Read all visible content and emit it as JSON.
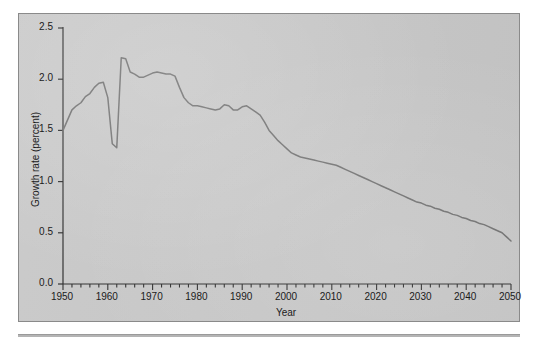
{
  "chart_data": {
    "type": "line",
    "title": "",
    "subtitle": "",
    "xlabel": "Year",
    "ylabel": "Growth rate (percent)",
    "xlim": [
      1950,
      2050
    ],
    "ylim": [
      0.0,
      2.5
    ],
    "grid": false,
    "legend": null,
    "legend_position": "none",
    "x_major_ticks": [
      1950,
      1960,
      1970,
      1980,
      1990,
      2000,
      2010,
      2020,
      2030,
      2040,
      2050
    ],
    "x_major_tick_labels": [
      "1950",
      "1960",
      "1970",
      "1980",
      "1990",
      "2000",
      "2010",
      "2020",
      "2030",
      "2040",
      "2050"
    ],
    "x_minor_tick_interval": 2,
    "y_ticks": [
      0.0,
      0.5,
      1.0,
      1.5,
      2.0,
      2.5
    ],
    "y_tick_labels": [
      "0.0",
      "0.5",
      "1.0",
      "1.5",
      "2.0",
      "2.5"
    ],
    "line_color": "#6e6e6e",
    "plot_background": "#c8c8c8",
    "series": [
      {
        "name": "World population growth rate",
        "x": [
          1950,
          1951,
          1952,
          1953,
          1954,
          1955,
          1956,
          1957,
          1958,
          1959,
          1960,
          1961,
          1962,
          1963,
          1964,
          1965,
          1966,
          1967,
          1968,
          1969,
          1970,
          1971,
          1972,
          1973,
          1974,
          1975,
          1976,
          1977,
          1978,
          1979,
          1980,
          1981,
          1982,
          1983,
          1984,
          1985,
          1986,
          1987,
          1988,
          1989,
          1990,
          1991,
          1992,
          1993,
          1994,
          1995,
          1996,
          1997,
          1998,
          1999,
          2000,
          2001,
          2002,
          2003,
          2004,
          2005,
          2006,
          2007,
          2008,
          2009,
          2010,
          2011,
          2012,
          2013,
          2014,
          2015,
          2016,
          2017,
          2018,
          2019,
          2020,
          2021,
          2022,
          2023,
          2024,
          2025,
          2026,
          2027,
          2028,
          2029,
          2030,
          2031,
          2032,
          2033,
          2034,
          2035,
          2036,
          2037,
          2038,
          2039,
          2040,
          2041,
          2042,
          2043,
          2044,
          2045,
          2046,
          2047,
          2048,
          2049,
          2050
        ],
        "y": [
          1.5,
          1.6,
          1.7,
          1.74,
          1.77,
          1.83,
          1.86,
          1.92,
          1.96,
          1.97,
          1.82,
          1.37,
          1.33,
          2.21,
          2.2,
          2.07,
          2.05,
          2.02,
          2.02,
          2.04,
          2.06,
          2.07,
          2.06,
          2.05,
          2.05,
          2.03,
          1.92,
          1.82,
          1.77,
          1.74,
          1.74,
          1.73,
          1.72,
          1.71,
          1.7,
          1.71,
          1.75,
          1.74,
          1.7,
          1.7,
          1.73,
          1.74,
          1.71,
          1.68,
          1.65,
          1.58,
          1.5,
          1.45,
          1.4,
          1.36,
          1.32,
          1.28,
          1.26,
          1.24,
          1.23,
          1.22,
          1.21,
          1.2,
          1.19,
          1.18,
          1.17,
          1.16,
          1.14,
          1.12,
          1.1,
          1.08,
          1.06,
          1.04,
          1.02,
          1.0,
          0.98,
          0.96,
          0.94,
          0.92,
          0.9,
          0.88,
          0.86,
          0.84,
          0.82,
          0.8,
          0.79,
          0.77,
          0.76,
          0.74,
          0.73,
          0.71,
          0.7,
          0.68,
          0.67,
          0.65,
          0.64,
          0.62,
          0.61,
          0.59,
          0.58,
          0.56,
          0.54,
          0.52,
          0.5,
          0.46,
          0.42
        ]
      }
    ],
    "annotations": [
      {
        "label": "peak",
        "year": 1963,
        "value": 2.21
      },
      {
        "label": "trough",
        "year": 1962,
        "value": 1.33
      },
      {
        "label": "start",
        "year": 1950,
        "value": 1.5
      },
      {
        "label": "end",
        "year": 2050,
        "value": 0.42
      }
    ]
  }
}
